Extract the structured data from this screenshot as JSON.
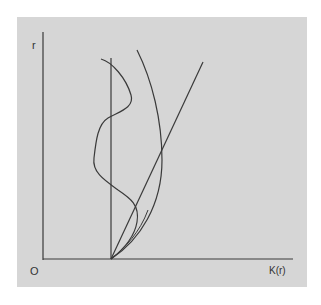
{
  "diagram": {
    "type": "graph-sketch",
    "background_color": "#d6d6d6",
    "line_color": "#3a3a3a",
    "axes": {
      "y_label": "r",
      "origin_label": "O",
      "x_label": "K(r)"
    },
    "elements": [
      {
        "name": "vertical-reference-line",
        "description": "vertical line from x-axis upward"
      },
      {
        "name": "diagonal-line",
        "description": "straight line rising from base point to upper right"
      },
      {
        "name": "arc-curve",
        "description": "curve bulging right, from base point to top"
      },
      {
        "name": "wiggly-curve",
        "description": "irregular curve oscillating around the vertical line"
      }
    ]
  }
}
